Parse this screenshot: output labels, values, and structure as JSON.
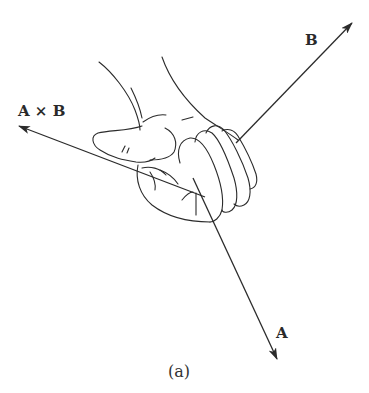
{
  "figure": {
    "caption": "(a)"
  },
  "vectors": [
    {
      "id": "axb",
      "label": "A × B",
      "color": "#2b2b2b"
    },
    {
      "id": "b",
      "label": "B",
      "color": "#2b2b2b"
    },
    {
      "id": "a",
      "label": "A",
      "color": "#2b2b2b"
    }
  ],
  "colors": {
    "line": "#2b2b2b",
    "background": "#ffffff"
  }
}
